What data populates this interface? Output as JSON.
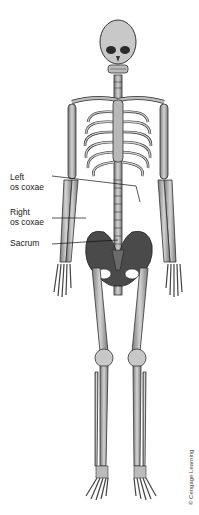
{
  "figure": {
    "labels": [
      {
        "id": "left-os-coxae",
        "line1": "Left",
        "line2": "os coxae"
      },
      {
        "id": "right-os-coxae",
        "line1": "Right",
        "line2": "os coxae"
      },
      {
        "id": "sacrum",
        "line1": "Sacrum"
      }
    ],
    "credit": "© Cengage Learning",
    "colors": {
      "bone": "#bdbdbd",
      "bone_dark": "#5a5a5a",
      "outline": "#333333",
      "pelvis": "#4a4a4a",
      "background": "#ffffff"
    }
  }
}
